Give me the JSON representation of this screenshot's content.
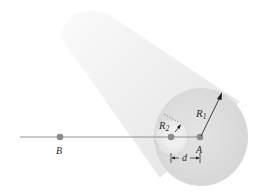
{
  "figure": {
    "labels": {
      "R1": "R",
      "R1_sub": "1",
      "R2": "R",
      "R2_sub": "2",
      "A": "A",
      "B": "B",
      "d": "d"
    },
    "colors": {
      "cylinder_body": "#ececec",
      "cylinder_highlight": "#fafafa",
      "end_face": "#dedede",
      "hole": "#f2f2f2",
      "point": "#8a8a8a",
      "line": "#7a7a7a",
      "arrow": "#1a1a1a"
    }
  }
}
